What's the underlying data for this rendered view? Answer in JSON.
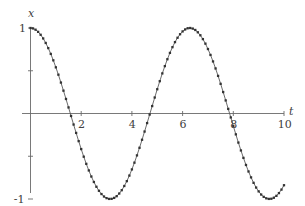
{
  "figure": {
    "background_color": "#ffffff",
    "ink_color": "#444444",
    "curve_color": "#555555",
    "marker_color": "#333333",
    "axis_color": "#666666"
  },
  "axes": {
    "x_axis_label": "t",
    "y_axis_label": "x",
    "x_ticks": [
      {
        "value": 2,
        "label": "2"
      },
      {
        "value": 4,
        "label": "4"
      },
      {
        "value": 6,
        "label": "6"
      },
      {
        "value": 8,
        "label": "8"
      },
      {
        "value": 10,
        "label": "10"
      }
    ],
    "y_ticks": [
      {
        "value": 1,
        "label": "1"
      },
      {
        "value": 0.5,
        "label": ""
      },
      {
        "value": -0.5,
        "label": ""
      },
      {
        "value": -1,
        "label": "-1"
      }
    ]
  },
  "chart_data": {
    "type": "line",
    "title": "",
    "subtitle": "",
    "xlabel": "t",
    "ylabel": "x",
    "xlim": [
      0,
      10
    ],
    "ylim": [
      -1,
      1
    ],
    "grid": false,
    "legend": null,
    "annotations": [],
    "series": [
      {
        "name": "x = cos(t)",
        "style": "line-with-markers",
        "marker": "square",
        "x": [
          0.0,
          0.1,
          0.2,
          0.3,
          0.4,
          0.5,
          0.6,
          0.7,
          0.8,
          0.9,
          1.0,
          1.1,
          1.2,
          1.3,
          1.4,
          1.5,
          1.6,
          1.7,
          1.8,
          1.9,
          2.0,
          2.1,
          2.2,
          2.3,
          2.4,
          2.5,
          2.6,
          2.7,
          2.8,
          2.9,
          3.0,
          3.1,
          3.2,
          3.3,
          3.4,
          3.5,
          3.6,
          3.7,
          3.8,
          3.9,
          4.0,
          4.1,
          4.2,
          4.3,
          4.4,
          4.5,
          4.6,
          4.7,
          4.8,
          4.9,
          5.0,
          5.1,
          5.2,
          5.3,
          5.4,
          5.5,
          5.6,
          5.7,
          5.8,
          5.9,
          6.0,
          6.1,
          6.2,
          6.3,
          6.4,
          6.5,
          6.6,
          6.7,
          6.8,
          6.9,
          7.0,
          7.1,
          7.2,
          7.3,
          7.4,
          7.5,
          7.6,
          7.7,
          7.8,
          7.9,
          8.0,
          8.1,
          8.2,
          8.3,
          8.4,
          8.5,
          8.6,
          8.7,
          8.8,
          8.9,
          9.0,
          9.1,
          9.2,
          9.3,
          9.4,
          9.5,
          9.6,
          9.7,
          9.8,
          9.9,
          10.0
        ],
        "y": [
          1.0,
          0.995,
          0.98,
          0.955,
          0.921,
          0.878,
          0.825,
          0.765,
          0.697,
          0.622,
          0.54,
          0.454,
          0.362,
          0.267,
          0.17,
          0.071,
          -0.029,
          -0.129,
          -0.227,
          -0.323,
          -0.416,
          -0.505,
          -0.589,
          -0.666,
          -0.737,
          -0.801,
          -0.857,
          -0.904,
          -0.942,
          -0.971,
          -0.99,
          -0.999,
          -0.998,
          -0.987,
          -0.967,
          -0.936,
          -0.897,
          -0.848,
          -0.791,
          -0.726,
          -0.654,
          -0.575,
          -0.49,
          -0.401,
          -0.307,
          -0.211,
          -0.112,
          -0.012,
          0.087,
          0.187,
          0.284,
          0.378,
          0.469,
          0.554,
          0.635,
          0.709,
          0.776,
          0.835,
          0.886,
          0.927,
          0.96,
          0.983,
          0.997,
          1.0,
          0.993,
          0.977,
          0.95,
          0.915,
          0.87,
          0.817,
          0.754,
          0.685,
          0.609,
          0.527,
          0.44,
          0.347,
          0.251,
          0.153,
          0.054,
          -0.046,
          -0.146,
          -0.244,
          -0.34,
          -0.432,
          -0.519,
          -0.602,
          -0.678,
          -0.747,
          -0.811,
          -0.866,
          -0.911,
          -0.948,
          -0.975,
          -0.992,
          -0.999,
          -0.997,
          -0.985,
          -0.963,
          -0.931,
          -0.89,
          -0.839
        ]
      }
    ]
  }
}
